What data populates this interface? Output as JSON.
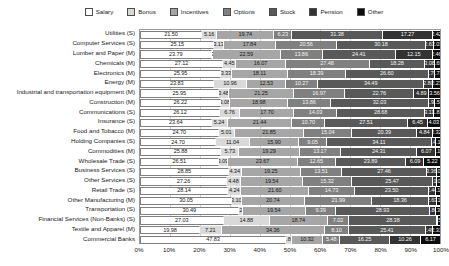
{
  "chart_data": {
    "type": "bar",
    "orientation": "horizontal",
    "stacked": true,
    "normalized": true,
    "title": "",
    "subtitle": "",
    "xlabel": "",
    "ylabel": "",
    "xlim": [
      0,
      100
    ],
    "xticks": [
      "0%",
      "10%",
      "20%",
      "30%",
      "40%",
      "50%",
      "60%",
      "70%",
      "80%",
      "90%",
      "100%"
    ],
    "grid": true,
    "legend_position": "top",
    "series_names": [
      "Salary",
      "Bonus",
      "Incentives",
      "Options",
      "Stock",
      "Pension",
      "Other"
    ],
    "series_colors": [
      "#ffffff",
      "#d9d9d9",
      "#a6a6a6",
      "#808080",
      "#595959",
      "#333333",
      "#0d0d0d"
    ],
    "categories": [
      "Utilities (S)",
      "Computer Services (S)",
      "Lumber and Paper (M)",
      "Chemicals (M)",
      "Electronics (M)",
      "Energy (M)",
      "Industrial and transportation equipment (M)",
      "Construction (M)",
      "Communications (S)",
      "Insurance (S)",
      "Food and Tobacco (M)",
      "Holding Companies (S)",
      "Commodities (M)",
      "Wholesale Trade (S)",
      "Business Services (S)",
      "Other Services (S)",
      "Retail Trade (S)",
      "Other Manufacturing (M)",
      "Transportation (S)",
      "Financial Services (Non-Banks) (S)",
      "Textile and Apparel (M)",
      "Commercial Banks"
    ],
    "series": [
      {
        "name": "Salary",
        "values": [
          21.5,
          25.15,
          23.79,
          27.12,
          25.95,
          23.83,
          25.95,
          26.22,
          26.12,
          23.64,
          24.7,
          24.7,
          25.88,
          26.51,
          28.85,
          27.26,
          28.14,
          30.05,
          30.49,
          27.03,
          19.98,
          47.83
        ]
      },
      {
        "name": "Bonus",
        "values": [
          5.16,
          3.13,
          0.39,
          4.45,
          3.33,
          10.96,
          3.48,
          3.08,
          6.76,
          5.24,
          5.01,
          11.04,
          5.73,
          3.09,
          4.34,
          4.48,
          4.24,
          3.1,
          1.28,
          14.88,
          7.21,
          1.88
        ]
      },
      {
        "name": "Incentives",
        "values": [
          19.74,
          17.84,
          22.59,
          16.07,
          18.11,
          12.53,
          21.25,
          18.98,
          17.7,
          21.44,
          21.85,
          15.9,
          19.29,
          23.67,
          19.25,
          19.54,
          21.6,
          20.74,
          19.54,
          18.74,
          34.36,
          10.32
        ]
      },
      {
        "name": "Options",
        "values": [
          6.23,
          20.56,
          13.86,
          27.48,
          18.39,
          10.27,
          16.97,
          13.86,
          14.03,
          10.7,
          15.04,
          9.05,
          13.17,
          12.65,
          13.51,
          15.32,
          14.73,
          21.99,
          9.39,
          7.02,
          8.1,
          5.48
        ]
      },
      {
        "name": "Stock",
        "values": [
          31.38,
          30.18,
          24.41,
          18.28,
          26.6,
          34.49,
          22.76,
          32.03,
          28.68,
          27.51,
          20.39,
          34.11,
          24.31,
          23.89,
          27.46,
          25.47,
          23.5,
          18.36,
          28.93,
          28.38,
          25.41,
          16.25
        ]
      },
      {
        "name": "Pension",
        "values": [
          17.27,
          2.63,
          12.15,
          3.08,
          1.79,
          2.8,
          4.89,
          1.92,
          3.11,
          6.45,
          4.84,
          1.48,
          6.07,
          6.09,
          3.36,
          1.1,
          2.44,
          2.63,
          1.8,
          0.33,
          2.49,
          10.26
        ]
      },
      {
        "name": "Other",
        "values": [
          2.42,
          2.03,
          2.46,
          1.69,
          1.73,
          2.23,
          3.56,
          1.54,
          1.81,
          4.03,
          2.32,
          1.13,
          1.14,
          5.22,
          1.02,
          1.05,
          1.15,
          1.1,
          1.31,
          0.52,
          2.31,
          6.17
        ]
      }
    ]
  },
  "legend": {
    "items": [
      {
        "label": "Salary",
        "color": "#ffffff"
      },
      {
        "label": "Bonus",
        "color": "#d9d9d9"
      },
      {
        "label": "Incentives",
        "color": "#a6a6a6"
      },
      {
        "label": "Options",
        "color": "#808080"
      },
      {
        "label": "Stock",
        "color": "#595959"
      },
      {
        "label": "Pension",
        "color": "#333333"
      },
      {
        "label": "Other",
        "color": "#0d0d0d"
      }
    ]
  }
}
